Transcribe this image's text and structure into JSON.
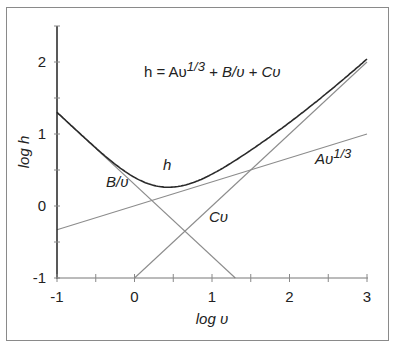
{
  "chart_data": {
    "type": "line",
    "title": "",
    "formula": {
      "prefix": "h = Aυ",
      "exp": "1/3",
      "mid": " + B/υ + Cυ"
    },
    "xlabel": "log υ",
    "ylabel": "log h",
    "xlim": [
      -1,
      3
    ],
    "ylim": [
      -1,
      2.5
    ],
    "xticks": [
      "-1",
      "0",
      "1",
      "2",
      "3"
    ],
    "yticks": [
      "-1",
      "0",
      "1",
      "2"
    ],
    "grid": false,
    "parameters": {
      "log_A": 0,
      "log_B": 0.3,
      "log_C": -1
    },
    "series": [
      {
        "name": "h",
        "label": "h",
        "style": "dark",
        "x": [
          -1,
          -0.5,
          0,
          0.5,
          1,
          1.5,
          2,
          2.5,
          3
        ],
        "values": [
          1.31,
          0.85,
          0.6,
          0.4,
          0.55,
          0.88,
          1.2,
          1.55,
          2.02
        ]
      },
      {
        "name": "B/υ",
        "label": "B/υ",
        "style": "light",
        "x": [
          -1,
          1.3
        ],
        "values": [
          1.3,
          -1.0
        ]
      },
      {
        "name": "Cυ",
        "label": "Cυ",
        "style": "light",
        "x": [
          0,
          3
        ],
        "values": [
          -1.0,
          2.0
        ]
      },
      {
        "name": "Aυ^1/3",
        "label_main": "Aυ",
        "label_exp": "1/3",
        "style": "light",
        "x": [
          -1,
          3
        ],
        "values": [
          -0.33,
          1.0
        ]
      }
    ]
  }
}
